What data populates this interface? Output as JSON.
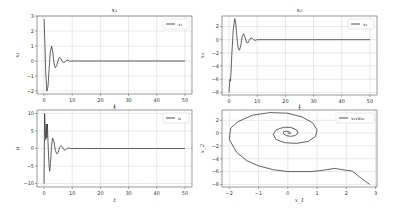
{
  "chart_data": [
    {
      "type": "line",
      "title": "x1",
      "xlabel": "t",
      "ylabel": "x1",
      "legend": [
        "x1"
      ],
      "legend_position": "upper right",
      "grid": true,
      "xlim": [
        -2.5,
        52.5
      ],
      "ylim": [
        -2.2,
        3.0
      ],
      "xticks": [
        0,
        10,
        20,
        30,
        40,
        50
      ],
      "yticks": [
        -2,
        -1,
        0,
        1,
        2,
        3
      ],
      "series": [
        {
          "name": "x1",
          "x": [
            0,
            0.3,
            0.6,
            1.0,
            1.4,
            1.8,
            2.2,
            2.7,
            3.1,
            3.5,
            4.0,
            4.5,
            5.0,
            5.5,
            6.0,
            6.5,
            7.0,
            7.5,
            8.0,
            8.5,
            9.0,
            9.5,
            10,
            12,
            15,
            20,
            30,
            40,
            50
          ],
          "y": [
            2.8,
            1.2,
            -0.8,
            -2.0,
            -1.7,
            -0.5,
            0.6,
            1.0,
            0.6,
            -0.1,
            -0.45,
            -0.3,
            0.05,
            0.25,
            0.15,
            -0.05,
            -0.12,
            -0.05,
            0.05,
            0.06,
            0.0,
            -0.02,
            0,
            0,
            0,
            0,
            0,
            0,
            0
          ]
        }
      ]
    },
    {
      "type": "line",
      "title": "x2",
      "xlabel": "t",
      "ylabel": "x2",
      "legend": [
        "x2"
      ],
      "legend_position": "upper right",
      "grid": true,
      "xlim": [
        -2.5,
        52.5
      ],
      "ylim": [
        -8.4,
        3.6
      ],
      "xticks": [
        0,
        10,
        20,
        30,
        40,
        50
      ],
      "yticks": [
        -8,
        -6,
        -4,
        -2,
        0,
        2
      ],
      "series": [
        {
          "name": "x2",
          "x": [
            0,
            0.2,
            0.4,
            0.5,
            0.7,
            1.0,
            1.5,
            2.0,
            2.3,
            2.7,
            3.2,
            3.7,
            4.2,
            4.7,
            5.2,
            5.7,
            6.2,
            6.7,
            7.2,
            7.7,
            8.2,
            8.7,
            9.2,
            10,
            12,
            15,
            20,
            30,
            40,
            50
          ],
          "y": [
            -8,
            -6.5,
            -6.0,
            -6.3,
            -5.0,
            -2.0,
            1.5,
            3.2,
            2.8,
            0.8,
            -1.2,
            -1.6,
            -0.8,
            0.6,
            0.9,
            0.3,
            -0.4,
            -0.5,
            -0.1,
            0.25,
            0.2,
            0.0,
            -0.1,
            0,
            0,
            0,
            0,
            0,
            0,
            0
          ]
        }
      ]
    },
    {
      "type": "line",
      "title": "",
      "xlabel": "t",
      "ylabel": "u",
      "legend": [
        "u"
      ],
      "legend_position": "upper right",
      "grid": true,
      "xlim": [
        -2.5,
        52.5
      ],
      "ylim": [
        -11,
        11
      ],
      "xticks": [
        0,
        10,
        20,
        30,
        40,
        50
      ],
      "yticks": [
        -10,
        -5,
        0,
        5,
        10
      ],
      "series": [
        {
          "name": "u",
          "x": [
            0,
            0.2,
            0.4,
            0.6,
            0.8,
            1.0,
            1.2,
            1.4,
            1.6,
            1.8,
            2.0,
            2.3,
            2.6,
            3.0,
            3.5,
            4.0,
            4.5,
            5.0,
            5.5,
            6.0,
            6.5,
            7.0,
            7.5,
            8.0,
            8.5,
            9.0,
            9.5,
            10,
            12,
            15,
            20,
            30,
            40,
            50
          ],
          "y": [
            -10,
            10,
            6,
            2.5,
            7,
            3,
            7,
            2,
            -2,
            -5,
            -6.5,
            -4,
            0,
            3,
            2,
            -0.5,
            -1.5,
            -1.2,
            0.3,
            0.8,
            0.5,
            -0.3,
            -0.5,
            -0.1,
            0.2,
            0.1,
            0,
            0,
            0,
            0,
            0,
            0,
            0,
            0
          ]
        }
      ]
    },
    {
      "type": "line",
      "title": "",
      "xlabel": "x_1",
      "ylabel": "x_2",
      "legend": [
        "x1 vs x2"
      ],
      "legend_position": "upper right",
      "grid": true,
      "xlim": [
        -2.25,
        3.05
      ],
      "ylim": [
        -8.4,
        3.6
      ],
      "xticks": [
        -2,
        -1,
        0,
        1,
        2,
        3
      ],
      "yticks": [
        -8,
        -6,
        -4,
        -2,
        0,
        2
      ],
      "series": [
        {
          "name": "x1 vs x2",
          "x": [
            2.8,
            2.5,
            2.2,
            2.0,
            1.6,
            1.2,
            0.8,
            0.4,
            0.0,
            -0.5,
            -1.0,
            -1.4,
            -1.75,
            -2.0,
            -1.95,
            -1.7,
            -1.2,
            -0.6,
            0.0,
            0.5,
            0.85,
            1.0,
            0.95,
            0.7,
            0.3,
            -0.1,
            -0.4,
            -0.5,
            -0.4,
            -0.15,
            0.1,
            0.3,
            0.35,
            0.25,
            0.1,
            -0.05,
            -0.15,
            -0.15,
            -0.05,
            0.05,
            0.1,
            0.05,
            0.0
          ],
          "y": [
            -8.0,
            -7.0,
            -5.9,
            -5.8,
            -5.5,
            -5.8,
            -6.0,
            -6.0,
            -6.0,
            -5.7,
            -5.1,
            -4.3,
            -3.0,
            -1.0,
            0.8,
            1.8,
            2.8,
            3.2,
            3.1,
            2.5,
            1.6,
            0.5,
            -0.5,
            -1.3,
            -1.6,
            -1.5,
            -1.0,
            -0.2,
            0.5,
            0.9,
            0.9,
            0.5,
            0.0,
            -0.4,
            -0.5,
            -0.4,
            -0.1,
            0.2,
            0.3,
            0.2,
            0.0,
            -0.05,
            0.0
          ]
        }
      ]
    }
  ],
  "panels": [
    {
      "title": "x₁",
      "xlabel": "t",
      "ylabel": "x₁",
      "legend": "x₁"
    },
    {
      "title": "x₂",
      "xlabel": "t",
      "ylabel": "x₂",
      "legend": "x₂"
    },
    {
      "title": "t",
      "xlabel": "t",
      "ylabel": "u",
      "legend": "u"
    },
    {
      "title": "t",
      "xlabel": "x_1",
      "ylabel": "x_2",
      "legend": "x₁vsx₂"
    }
  ],
  "colors": {
    "line": "#3a3a3a",
    "grid": "#d0d0d0",
    "axis": "#555555",
    "legend_border": "#cccccc"
  }
}
